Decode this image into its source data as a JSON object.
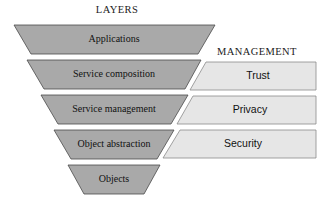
{
  "figure": {
    "type": "diagram",
    "subtype": "inverted-funnel-layer-stack",
    "background_color": "#ffffff"
  },
  "layers_column": {
    "heading": "LAYERS",
    "heading_center": {
      "x": 117,
      "y": 11
    },
    "fill_color": "#a9a9a9",
    "stroke_color": "#4a4a4a",
    "items": [
      {
        "label": "Applications",
        "points": "14,25 215,25 198,54 31,54",
        "label_x": 114,
        "label_y": 40
      },
      {
        "label": "Service composition",
        "points": "27,60 201,60 185,89 44,89",
        "label_x": 114,
        "label_y": 75
      },
      {
        "label": "Service management",
        "points": "41,95 188,95 171,124 58,124",
        "label_x": 114,
        "label_y": 110
      },
      {
        "label": "Object abstraction",
        "points": "54,130 174,130 157,159 71,159",
        "label_x": 114,
        "label_y": 145
      },
      {
        "label": "Objects",
        "points": "68,165 160,165 144,194 84,194",
        "label_x": 114,
        "label_y": 180
      }
    ]
  },
  "management_column": {
    "heading": "MANAGEMENT",
    "heading_center": {
      "x": 257,
      "y": 53
    },
    "fill_color": "#e6e6e6",
    "stroke_color": "#8a8a8a",
    "items": [
      {
        "label": "Trust",
        "points": "206,62 316,62 316,90 190,90",
        "label_x": 258,
        "label_y": 76
      },
      {
        "label": "Privacy",
        "points": "193,96 316,96 316,124 177,124",
        "label_x": 250,
        "label_y": 110
      },
      {
        "label": "Security",
        "points": "180,130 316,130 316,158 163,158",
        "label_x": 243,
        "label_y": 144
      }
    ]
  }
}
